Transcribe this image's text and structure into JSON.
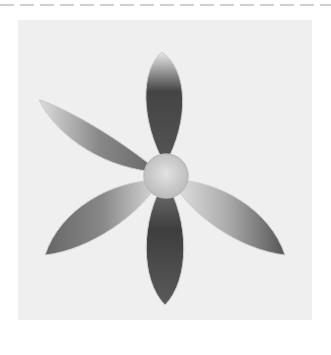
{
  "image": {
    "subject": "embroidered six-petal flower",
    "palette": {
      "background": "#ffffff",
      "fabric": "#efefef",
      "petal_dark": "#3a3a3a",
      "petal_light": "#e6e6e6",
      "center": "#cfcfcf",
      "dash": "#cfcfcf"
    },
    "petal_count": 6
  }
}
